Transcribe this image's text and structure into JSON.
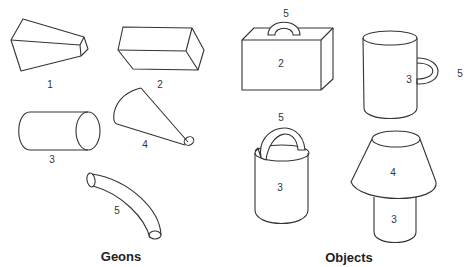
{
  "captions": {
    "geons": "Geons",
    "objects": "Objects"
  },
  "geons": [
    {
      "id": 1,
      "label": "1",
      "shape": "truncated-pyramid"
    },
    {
      "id": 2,
      "label": "2",
      "shape": "rectangular-block"
    },
    {
      "id": 3,
      "label": "3",
      "shape": "cylinder"
    },
    {
      "id": 4,
      "label": "4",
      "shape": "cone"
    },
    {
      "id": 5,
      "label": "5",
      "shape": "curved-tube"
    }
  ],
  "objects": [
    {
      "name": "briefcase",
      "parts": [
        {
          "label": "2"
        },
        {
          "label": "5"
        }
      ]
    },
    {
      "name": "mug",
      "parts": [
        {
          "label": "3"
        },
        {
          "label": "5"
        }
      ]
    },
    {
      "name": "bucket",
      "parts": [
        {
          "label": "3"
        },
        {
          "label": "5"
        }
      ]
    },
    {
      "name": "lamp",
      "parts": [
        {
          "label": "4"
        },
        {
          "label": "3"
        }
      ]
    }
  ]
}
